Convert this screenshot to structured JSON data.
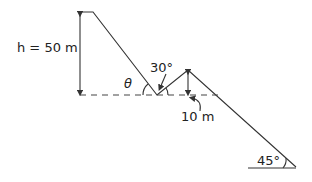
{
  "diagram": {
    "labels": {
      "height": "h = 50 m",
      "theta": "θ",
      "angle_30": "30°",
      "drop": "10 m",
      "angle_45": "45°"
    },
    "colors": {
      "line": "#333333",
      "text": "#222222",
      "background": "#ffffff"
    }
  }
}
